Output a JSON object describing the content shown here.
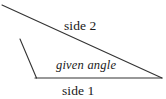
{
  "figure": {
    "width": 166,
    "height": 99,
    "background_color": "#ffffff",
    "stroke_color": "#333333",
    "text_color": "#1a1a1a",
    "labels": {
      "side2": "side 2",
      "side1": "side 1",
      "given_angle": "given angle"
    },
    "geometry": {
      "vertex_angle": {
        "x": 36,
        "y": 78
      },
      "vertex_right": {
        "x": 162,
        "y": 78
      },
      "side2_start": {
        "x": 2,
        "y": 5
      },
      "side2_end": {
        "x": 162,
        "y": 78
      },
      "left_side_top": {
        "x": 20,
        "y": 39
      },
      "left_side_bottom": {
        "x": 36,
        "y": 78
      },
      "baseline_start": {
        "x": 36,
        "y": 78
      },
      "baseline_end": {
        "x": 162,
        "y": 78
      }
    }
  }
}
